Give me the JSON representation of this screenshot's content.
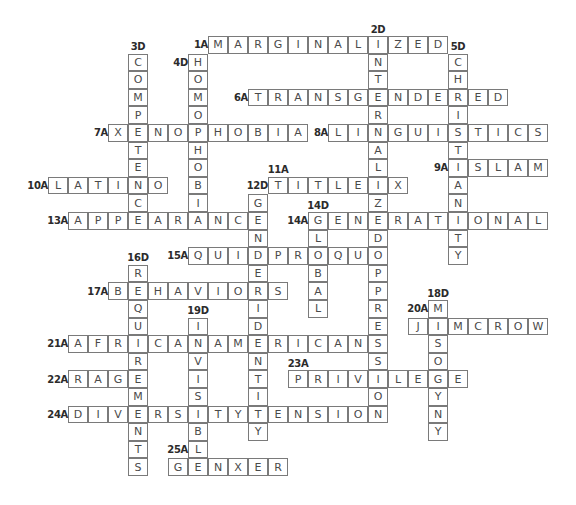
{
  "puzzle": {
    "layout": {
      "origin_x": 8,
      "origin_y": 36,
      "cell_w": 20,
      "cell_h": 17.6
    },
    "colors": {
      "border": "#7a7a7a",
      "letter": "#4a4a4a",
      "label": "#2b2b2b",
      "background": "#ffffff"
    },
    "words": [
      {
        "id": "1A",
        "dir": "across",
        "row": 0,
        "col": 10,
        "answer": "MARGINALIZED"
      },
      {
        "id": "2D",
        "dir": "down",
        "row": 0,
        "col": 18,
        "answer": "INTERNALIZEDOPPRESSION"
      },
      {
        "id": "3D",
        "dir": "down",
        "row": 1,
        "col": 6,
        "answer": "COMPETENCE"
      },
      {
        "id": "4D",
        "dir": "down",
        "row": 1,
        "col": 9,
        "answer": "HOMOPHOBIA"
      },
      {
        "id": "5D",
        "dir": "down",
        "row": 1,
        "col": 22,
        "answer": "CHRISTIANITY"
      },
      {
        "id": "6A",
        "dir": "across",
        "row": 3,
        "col": 12,
        "answer": "TRANSGENDERED"
      },
      {
        "id": "7A",
        "dir": "across",
        "row": 5,
        "col": 5,
        "answer": "XENOPHOBIA"
      },
      {
        "id": "8A",
        "dir": "across",
        "row": 5,
        "col": 16,
        "answer": "LINGUISTICS"
      },
      {
        "id": "9A",
        "dir": "across",
        "row": 7,
        "col": 22,
        "answer": "ISLAM"
      },
      {
        "id": "10A",
        "dir": "across",
        "row": 8,
        "col": 2,
        "answer": "LATINO"
      },
      {
        "id": "11A",
        "dir": "across",
        "row": 8,
        "col": 13,
        "answer": "TITLEIX"
      },
      {
        "id": "12D",
        "dir": "down",
        "row": 9,
        "col": 12,
        "answer": "GENDERIDENTITY"
      },
      {
        "id": "13A",
        "dir": "across",
        "row": 10,
        "col": 3,
        "answer": "APPEARANCE"
      },
      {
        "id": "14A",
        "dir": "across",
        "row": 10,
        "col": 15,
        "answer": "GENERATIONAL"
      },
      {
        "id": "14D",
        "dir": "down",
        "row": 10,
        "col": 15,
        "answer": "GLOBAL"
      },
      {
        "id": "15A",
        "dir": "across",
        "row": 12,
        "col": 9,
        "answer": "QUIDPROQUO"
      },
      {
        "id": "16D",
        "dir": "down",
        "row": 13,
        "col": 6,
        "answer": "REQUIREMENTS"
      },
      {
        "id": "17A",
        "dir": "across",
        "row": 14,
        "col": 5,
        "answer": "BEHAVIORS"
      },
      {
        "id": "18D",
        "dir": "down",
        "row": 15,
        "col": 21,
        "answer": "MISOGYNY"
      },
      {
        "id": "19D",
        "dir": "down",
        "row": 16,
        "col": 9,
        "answer": "INVISIBLE"
      },
      {
        "id": "20A",
        "dir": "across",
        "row": 16,
        "col": 20,
        "answer": "JIMCROW"
      },
      {
        "id": "21A",
        "dir": "across",
        "row": 17,
        "col": 3,
        "answer": "AFRICANAMERICANS"
      },
      {
        "id": "22A",
        "dir": "across",
        "row": 19,
        "col": 3,
        "answer": "RAGE"
      },
      {
        "id": "23A",
        "dir": "across",
        "row": 19,
        "col": 14,
        "answer": "PRIVILEGE"
      },
      {
        "id": "24A",
        "dir": "across",
        "row": 21,
        "col": 3,
        "answer": "DIVERSITYTENSION"
      },
      {
        "id": "25A",
        "dir": "across",
        "row": 24,
        "col": 8,
        "answer": "GENXER"
      }
    ],
    "labels": [
      {
        "text": "1A",
        "row": 0,
        "col": 9,
        "pos": "left"
      },
      {
        "text": "2D",
        "row": -1,
        "col": 18,
        "pos": "above"
      },
      {
        "text": "3D",
        "row": 0,
        "col": 6,
        "pos": "above"
      },
      {
        "text": "4D",
        "row": 1,
        "col": 8,
        "pos": "left"
      },
      {
        "text": "5D",
        "row": 0,
        "col": 22,
        "pos": "above"
      },
      {
        "text": "6A",
        "row": 3,
        "col": 11,
        "pos": "left"
      },
      {
        "text": "7A",
        "row": 5,
        "col": 4,
        "pos": "left"
      },
      {
        "text": "8A",
        "row": 5,
        "col": 15,
        "pos": "left"
      },
      {
        "text": "9A",
        "row": 7,
        "col": 21,
        "pos": "left"
      },
      {
        "text": "10A",
        "row": 8,
        "col": 1,
        "pos": "left"
      },
      {
        "text": "11A",
        "row": 7,
        "col": 13,
        "pos": "above"
      },
      {
        "text": "12D",
        "row": 8,
        "col": 12,
        "pos": "left"
      },
      {
        "text": "13A",
        "row": 10,
        "col": 2,
        "pos": "left"
      },
      {
        "text": "14D",
        "row": 9,
        "col": 15,
        "pos": "above"
      },
      {
        "text": "14A",
        "row": 10,
        "col": 14,
        "pos": "left"
      },
      {
        "text": "15A",
        "row": 12,
        "col": 8,
        "pos": "left"
      },
      {
        "text": "16D",
        "row": 12,
        "col": 6,
        "pos": "above"
      },
      {
        "text": "17A",
        "row": 14,
        "col": 4,
        "pos": "left"
      },
      {
        "text": "18D",
        "row": 14,
        "col": 21,
        "pos": "above"
      },
      {
        "text": "19D",
        "row": 15,
        "col": 9,
        "pos": "above"
      },
      {
        "text": "20A",
        "row": 15,
        "col": 20,
        "pos": "left"
      },
      {
        "text": "21A",
        "row": 17,
        "col": 2,
        "pos": "left"
      },
      {
        "text": "22A",
        "row": 19,
        "col": 2,
        "pos": "left"
      },
      {
        "text": "23A",
        "row": 18,
        "col": 14,
        "pos": "above"
      },
      {
        "text": "24A",
        "row": 21,
        "col": 2,
        "pos": "left"
      },
      {
        "text": "25A",
        "row": 23,
        "col": 8,
        "pos": "left"
      }
    ]
  }
}
